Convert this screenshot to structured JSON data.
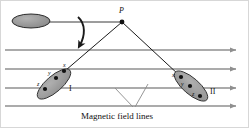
{
  "figure": {
    "caption": "Magnetic field lines",
    "colors": {
      "field_line": "#8f8f8f",
      "ray": "#1a1a1a",
      "ellipse_fill": "#9a9a9a",
      "ellipse_stroke": "#2e2e2e",
      "source_fill": "#8c8c8c",
      "source_stroke": "#2b2b2b",
      "dot": "#111111",
      "text": "#111111",
      "border": "#cfcfcf"
    }
  },
  "vertex": {
    "label": "P",
    "x": 122,
    "y": 22
  },
  "source": {
    "label": "",
    "cx": 31,
    "cy": 21,
    "rx": 19,
    "ry": 7
  },
  "rotation_arrow": {
    "name": "curved rotation arrow",
    "direction": "clockwise-down"
  },
  "field_lines": [
    {
      "y": 50,
      "x_start": 5,
      "x_end": 238,
      "arrow": "right"
    },
    {
      "y": 69,
      "x_start": 5,
      "x_end": 238,
      "arrow": "right"
    },
    {
      "y": 88,
      "x_start": 5,
      "x_end": 238,
      "arrow": "right"
    },
    {
      "y": 106,
      "x_start": 5,
      "x_end": 238,
      "arrow": "right"
    }
  ],
  "objects": [
    {
      "name": "object-I",
      "label": "I",
      "label_x": 69,
      "label_y": 86,
      "cx": 54,
      "cy": 84,
      "rx": 21,
      "ry": 8,
      "rotation": -41,
      "points": [
        {
          "label": "x",
          "x": 64,
          "y": 71
        },
        {
          "label": "y",
          "x": 56,
          "y": 78
        },
        {
          "label": "z",
          "x": 45,
          "y": 89
        }
      ]
    },
    {
      "name": "object-II",
      "label": "II",
      "label_x": 211,
      "label_y": 93,
      "cx": 191,
      "cy": 86,
      "rx": 21,
      "ry": 8,
      "rotation": 41,
      "points": [
        {
          "label": "x",
          "x": 181,
          "y": 77
        },
        {
          "label": "y",
          "x": 190,
          "y": 86
        },
        {
          "label": "z",
          "x": 200,
          "y": 96
        }
      ]
    }
  ],
  "rays": [
    {
      "name": "ray-to-object-I",
      "x1": 122,
      "y1": 22,
      "x2": 66,
      "y2": 70
    },
    {
      "name": "ray-to-object-II",
      "x1": 122,
      "y1": 22,
      "x2": 179,
      "y2": 75
    }
  ],
  "caption": {
    "text": "Magnetic field lines",
    "x": 122,
    "y": 117,
    "leaders": [
      {
        "x1": 133,
        "y1": 107,
        "x2": 115,
        "y2": 88
      },
      {
        "x1": 135,
        "y1": 107,
        "x2": 148,
        "y2": 84
      }
    ]
  }
}
